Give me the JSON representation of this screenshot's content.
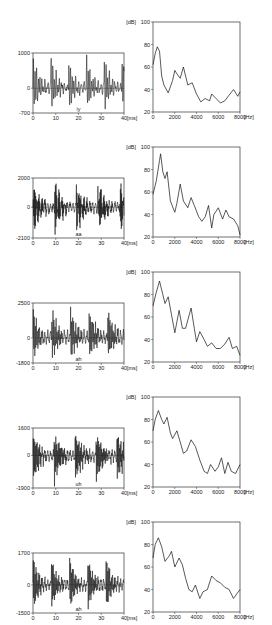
{
  "chart_data": [
    {
      "type": "line",
      "panel": "waveform",
      "vowel": "iy",
      "xlabel": "[ms]",
      "ylim": [
        -700,
        1000
      ],
      "yticks": [
        "1000",
        "0",
        "-700"
      ],
      "xticks": [
        "0",
        "10",
        "20",
        "30",
        "40"
      ]
    },
    {
      "type": "line",
      "panel": "spectrum",
      "vowel": "iy",
      "ylabel": "[dB]",
      "xlabel": "[Hz]",
      "ylim": [
        20,
        100
      ],
      "yticks": [
        "100",
        "80",
        "60",
        "40",
        "20"
      ],
      "xticks": [
        "0",
        "2000",
        "4000",
        "6000",
        "8000"
      ],
      "x": [
        0,
        200,
        400,
        600,
        800,
        1000,
        1400,
        1800,
        2000,
        2200,
        2500,
        2800,
        3000,
        3200,
        3600,
        4000,
        4400,
        4800,
        5200,
        5400,
        5800,
        6200,
        6600,
        7000,
        7400,
        7800,
        8000
      ],
      "values": [
        62,
        72,
        78,
        74,
        52,
        44,
        37,
        48,
        57,
        54,
        50,
        60,
        52,
        44,
        46,
        36,
        29,
        32,
        30,
        36,
        32,
        28,
        30,
        35,
        40,
        34,
        38
      ]
    },
    {
      "type": "line",
      "panel": "waveform",
      "vowel": "aa",
      "xlabel": "[ms]",
      "ylim": [
        -2100,
        2000
      ],
      "yticks": [
        "2000",
        "0",
        "-2100"
      ],
      "xticks": [
        "0",
        "10",
        "20",
        "30",
        "40"
      ]
    },
    {
      "type": "line",
      "panel": "spectrum",
      "vowel": "aa",
      "ylabel": "[dB]",
      "xlabel": "[Hz]",
      "ylim": [
        20,
        100
      ],
      "yticks": [
        "100",
        "80",
        "60",
        "40",
        "20"
      ],
      "xticks": [
        "0",
        "2000",
        "4000",
        "6000",
        "8000"
      ],
      "x": [
        0,
        300,
        600,
        700,
        900,
        1100,
        1300,
        1600,
        2000,
        2200,
        2500,
        2800,
        3200,
        3500,
        3800,
        4200,
        4500,
        4800,
        5100,
        5400,
        5600,
        6000,
        6400,
        6700,
        7000,
        7400,
        7800,
        8000
      ],
      "values": [
        58,
        70,
        88,
        94,
        78,
        72,
        78,
        52,
        42,
        50,
        67,
        52,
        46,
        55,
        48,
        38,
        34,
        38,
        48,
        28,
        40,
        46,
        36,
        44,
        38,
        36,
        30,
        22
      ]
    },
    {
      "type": "line",
      "panel": "waveform",
      "vowel": "ah",
      "xlabel": "[ms]",
      "ylim": [
        -1800,
        2500
      ],
      "yticks": [
        "2500",
        "0",
        "-1800"
      ],
      "xticks": [
        "0",
        "10",
        "20",
        "30",
        "40"
      ]
    },
    {
      "type": "line",
      "panel": "spectrum",
      "vowel": "ah",
      "ylabel": "[dB]",
      "xlabel": "[Hz]",
      "ylim": [
        20,
        100
      ],
      "yticks": [
        "100",
        "80",
        "60",
        "40",
        "20"
      ],
      "xticks": [
        "0",
        "2000",
        "4000",
        "6000",
        "8000"
      ],
      "x": [
        0,
        300,
        600,
        900,
        1100,
        1400,
        1700,
        2000,
        2400,
        2700,
        3000,
        3500,
        3800,
        4000,
        4300,
        4700,
        5000,
        5400,
        5800,
        6200,
        6600,
        7000,
        7300,
        7700,
        8000
      ],
      "values": [
        70,
        82,
        92,
        80,
        72,
        78,
        62,
        46,
        66,
        50,
        50,
        68,
        50,
        38,
        47,
        40,
        34,
        37,
        32,
        32,
        36,
        42,
        32,
        34,
        26
      ]
    },
    {
      "type": "line",
      "panel": "waveform",
      "vowel": "uh",
      "xlabel": "[ms]",
      "ylim": [
        -1900,
        1600
      ],
      "yticks": [
        "1600",
        "0",
        "-1900"
      ],
      "xticks": [
        "0",
        "10",
        "20",
        "30",
        "40"
      ]
    },
    {
      "type": "line",
      "panel": "spectrum",
      "vowel": "uh",
      "ylabel": "[dB]",
      "xlabel": "[Hz]",
      "ylim": [
        20,
        100
      ],
      "yticks": [
        "100",
        "80",
        "60",
        "40",
        "20"
      ],
      "xticks": [
        "0",
        "2000",
        "4000",
        "6000",
        "8000"
      ],
      "x": [
        0,
        200,
        500,
        800,
        1000,
        1300,
        1600,
        1800,
        2200,
        2500,
        2800,
        3100,
        3500,
        3900,
        4300,
        4700,
        5000,
        5300,
        5700,
        6000,
        6300,
        6600,
        6900,
        7200,
        7600,
        8000
      ],
      "values": [
        70,
        80,
        88,
        80,
        76,
        82,
        68,
        63,
        70,
        60,
        50,
        52,
        62,
        56,
        44,
        34,
        32,
        40,
        34,
        38,
        46,
        32,
        42,
        34,
        32,
        40
      ]
    },
    {
      "type": "line",
      "panel": "waveform",
      "vowel": "ah",
      "xlabel": "[ms]",
      "ylim": [
        -1500,
        1700
      ],
      "yticks": [
        "1700",
        "0",
        "-1500"
      ],
      "xticks": [
        "0",
        "10",
        "20",
        "30",
        "40"
      ]
    },
    {
      "type": "line",
      "panel": "spectrum",
      "vowel": "ah",
      "ylabel": "[dB]",
      "xlabel": "[Hz]",
      "ylim": [
        20,
        100
      ],
      "yticks": [
        "100",
        "80",
        "60",
        "40",
        "20"
      ],
      "xticks": [
        "0",
        "2000",
        "4000",
        "6000",
        "8000"
      ],
      "x": [
        0,
        200,
        500,
        800,
        1100,
        1500,
        1700,
        2000,
        2400,
        2700,
        3000,
        3300,
        3600,
        3900,
        4300,
        4600,
        5000,
        5400,
        5800,
        6200,
        6600,
        7000,
        7400,
        7700,
        8000
      ],
      "values": [
        68,
        80,
        86,
        78,
        65,
        70,
        74,
        60,
        68,
        62,
        50,
        40,
        38,
        44,
        32,
        38,
        40,
        52,
        48,
        46,
        42,
        40,
        32,
        36,
        40
      ]
    }
  ]
}
